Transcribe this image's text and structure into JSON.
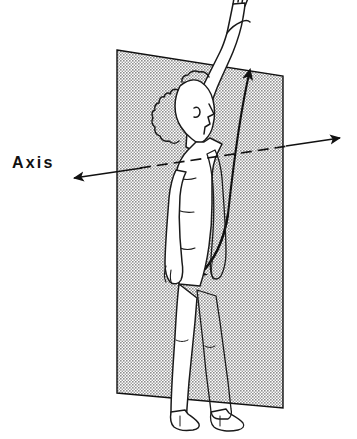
{
  "diagram": {
    "background_color": "#ffffff",
    "ink_color": "#111111",
    "labels": [
      {
        "id": "axis",
        "text": "Axis",
        "x": 12,
        "y": 152
      }
    ],
    "plane": {
      "name": "frontal-plane",
      "fill_color": "#a8a8a8",
      "stroke_color": "#111111",
      "pattern": "halftone-stipple",
      "corners": [
        {
          "x": 117,
          "y": 50
        },
        {
          "x": 283,
          "y": 76
        },
        {
          "x": 283,
          "y": 408
        },
        {
          "x": 117,
          "y": 393
        }
      ]
    },
    "axis_line": {
      "name": "sagittal-axis",
      "style": "solid-outside-dashed-through-body",
      "left_tip": {
        "x": 62,
        "y": 170
      },
      "right_tip": {
        "x": 348,
        "y": 130
      },
      "arrowheads": [
        "left",
        "right"
      ],
      "dashed_span": {
        "x1": 140,
        "x2": 286
      }
    },
    "motion_arrow": {
      "name": "abduction-adduction-arc",
      "style": "curved-double-headed",
      "top_tip": {
        "x": 251,
        "y": 60
      },
      "bottom_tip": {
        "x": 195,
        "y": 279
      },
      "arrowheads": [
        "top",
        "bottom"
      ]
    },
    "figure": {
      "name": "human-figure",
      "view": "lateral-profile-facing-right",
      "fill_color": "#ffffff",
      "stroke_color": "#1a1a1a",
      "parts": [
        "raised-arm-overhead",
        "open-hand",
        "head-profile",
        "curly-hair",
        "torso",
        "hanging-arm",
        "legs",
        "feet"
      ]
    }
  }
}
